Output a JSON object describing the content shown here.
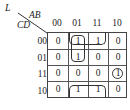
{
  "kmap": {
    "output_label": "L",
    "col_var_label": "AB",
    "row_var_label": "CD",
    "col_headers": [
      "00",
      "01",
      "11",
      "10"
    ],
    "row_headers": [
      "00",
      "01",
      "11",
      "10"
    ],
    "cells": [
      [
        "0",
        "1",
        "1",
        "0"
      ],
      [
        "0",
        "1",
        "0",
        "0"
      ],
      [
        "0",
        "0",
        "0",
        "1"
      ],
      [
        "0",
        "1",
        "1",
        "0"
      ]
    ],
    "groupings": [
      {
        "type": "loop",
        "cells": [
          "r0c1",
          "r1c1"
        ],
        "description": "vertical pair AB=01, CD=00/01"
      },
      {
        "type": "loop",
        "cells": [
          "r0c1",
          "r0c2"
        ],
        "description": "horizontal pair top row, wraps with bottom row"
      },
      {
        "type": "loop",
        "cells": [
          "r3c1",
          "r3c2"
        ],
        "description": "horizontal pair bottom row, wraps with top row"
      },
      {
        "type": "circle",
        "cells": [
          "r2c3"
        ],
        "description": "single minterm AB=10, CD=11"
      }
    ]
  }
}
